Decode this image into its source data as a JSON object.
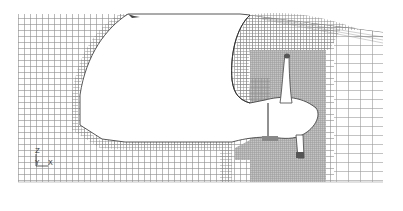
{
  "diagram": {
    "type": "computational-mesh",
    "background_color": "#ffffff",
    "mesh_color": "#9a9a9a",
    "dense_mesh_color": "#a8a8a8",
    "wall_color": "#555555",
    "domain": {
      "x0": 18,
      "y0": 14,
      "x1": 383,
      "y1": 182
    },
    "coarse_spacing": 6,
    "far_spacing": 12,
    "fine_spacing": 2
  },
  "axes_triad": {
    "z_label": "Z",
    "y_label": "Y",
    "x_label": "X"
  }
}
